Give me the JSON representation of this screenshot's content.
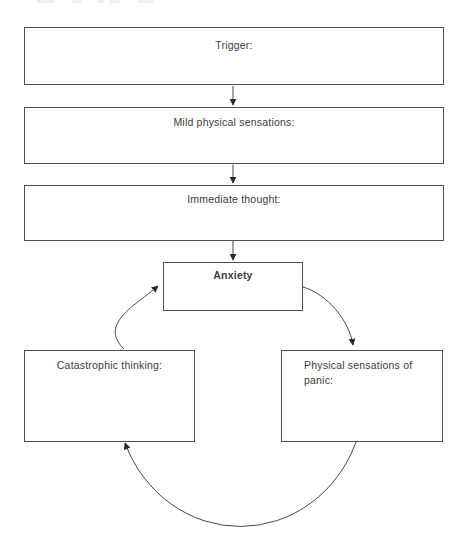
{
  "diagram": {
    "flow_boxes": [
      {
        "label": "Trigger:"
      },
      {
        "label": "Mild physical sensations:"
      },
      {
        "label": "Immediate thought:"
      }
    ],
    "cycle": {
      "top_box": {
        "label": "Anxiety"
      },
      "left_box": {
        "label": "Catastrophic thinking:"
      },
      "right_box": {
        "label": "Physical sensations of panic:"
      }
    },
    "arrows": [
      "trigger-to-mild-arrow",
      "mild-to-immediate-arrow",
      "immediate-to-anxiety-arrow",
      "anxiety-to-physical-curve-arrow",
      "physical-to-catastrophic-curve-arrow",
      "catastrophic-to-anxiety-curve-arrow"
    ],
    "colors": {
      "line": "#474747",
      "arrowhead": "#2b2b2b",
      "border": "#4f4f4f",
      "text": "#3c3c3c",
      "background": "#ffffff"
    }
  }
}
